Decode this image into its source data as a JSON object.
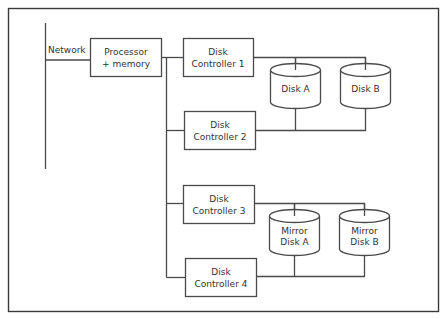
{
  "diagram": {
    "network": {
      "label": "Network"
    },
    "processor": {
      "line1": "Processor",
      "line2": "+ memory"
    },
    "controllers": [
      {
        "line1": "Disk",
        "line2": "Controller 1"
      },
      {
        "line1": "Disk",
        "line2": "Controller 2"
      },
      {
        "line1": "Disk",
        "line2": "Controller 3"
      },
      {
        "line1": "Disk",
        "line2": "Controller 4"
      }
    ],
    "disks": [
      {
        "line1": "Disk A",
        "line2": ""
      },
      {
        "line1": "Disk B",
        "line2": ""
      },
      {
        "line1": "Mirror",
        "line2": "Disk A"
      },
      {
        "line1": "Mirror",
        "line2": "Disk B"
      }
    ],
    "colors": {
      "stroke": "#4a4a4a",
      "text": "#333333",
      "background": "#ffffff"
    }
  }
}
